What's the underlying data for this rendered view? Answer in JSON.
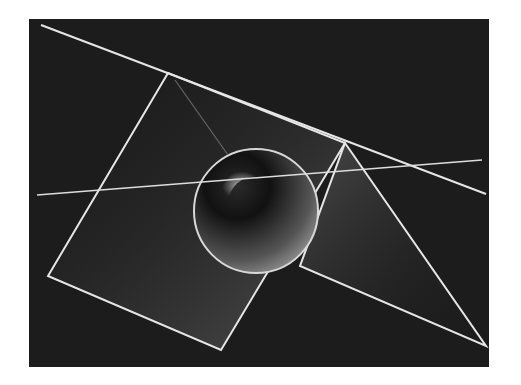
{
  "image": {
    "description": "Grayscale abstract render: glossy translucent sphere with intersecting white lines, a tilted square, and a triangle on a dark textured background",
    "background_color": "#1a1a1a",
    "line_color": "#e6e6e6",
    "canvas": {
      "x": 29,
      "y": 19,
      "width": 209,
      "height": 160
    }
  },
  "shapes": {
    "sphere": {
      "cx": 256,
      "cy": 211,
      "r": 62
    },
    "long_line_top": {
      "x1": 41,
      "y1": 25,
      "x2": 486,
      "y2": 194
    },
    "horizontal_line": {
      "x1": 37,
      "y1": 195,
      "x2": 482,
      "y2": 160
    },
    "square": [
      [
        168,
        73
      ],
      [
        48,
        276
      ],
      [
        221,
        350
      ],
      [
        345,
        143
      ]
    ],
    "triangle": [
      [
        345,
        143
      ],
      [
        486,
        346
      ],
      [
        300,
        266
      ]
    ],
    "faint_line": {
      "x1": 175,
      "y1": 80,
      "x2": 228,
      "y2": 155
    }
  }
}
